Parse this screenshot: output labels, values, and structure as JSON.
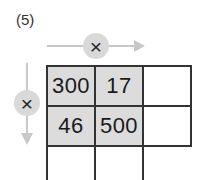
{
  "problem": {
    "label": "(5)",
    "horizontal_operator": "×",
    "vertical_operator": "×",
    "arrow_color": "#c8c8c8",
    "operator_circle_color": "#d9d9d9",
    "shaded_cell_color": "#dcdcdc"
  },
  "grid": {
    "rows": [
      [
        "300",
        "17",
        ""
      ],
      [
        "46",
        "500",
        ""
      ],
      [
        "",
        "",
        ""
      ]
    ]
  }
}
